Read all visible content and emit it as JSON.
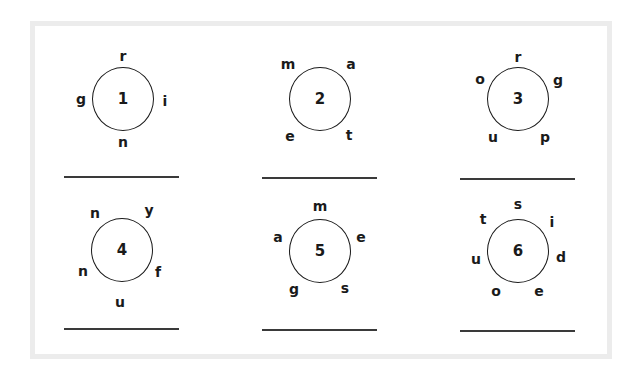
{
  "worksheet": {
    "puzzles": [
      {
        "number": "1",
        "letters": [
          {
            "char": "r",
            "dx": 0,
            "dy": -43
          },
          {
            "char": "g",
            "dx": -42,
            "dy": 0
          },
          {
            "char": "i",
            "dx": 42,
            "dy": 2
          },
          {
            "char": "n",
            "dx": 0,
            "dy": 43
          }
        ]
      },
      {
        "number": "2",
        "letters": [
          {
            "char": "m",
            "dx": -32,
            "dy": -35
          },
          {
            "char": "a",
            "dx": 31,
            "dy": -35
          },
          {
            "char": "e",
            "dx": -30,
            "dy": 37
          },
          {
            "char": "t",
            "dx": 29,
            "dy": 36
          }
        ]
      },
      {
        "number": "3",
        "letters": [
          {
            "char": "r",
            "dx": 0,
            "dy": -42
          },
          {
            "char": "o",
            "dx": -38,
            "dy": -20
          },
          {
            "char": "g",
            "dx": 40,
            "dy": -19
          },
          {
            "char": "u",
            "dx": -25,
            "dy": 38
          },
          {
            "char": "p",
            "dx": 27,
            "dy": 38
          }
        ]
      },
      {
        "number": "4",
        "letters": [
          {
            "char": "n",
            "dx": -27,
            "dy": -37
          },
          {
            "char": "y",
            "dx": 27,
            "dy": -40
          },
          {
            "char": "n",
            "dx": -39,
            "dy": 21
          },
          {
            "char": "f",
            "dx": 36,
            "dy": 22
          },
          {
            "char": "u",
            "dx": -2,
            "dy": 52
          }
        ]
      },
      {
        "number": "5",
        "letters": [
          {
            "char": "m",
            "dx": 0,
            "dy": -45
          },
          {
            "char": "a",
            "dx": -42,
            "dy": -14
          },
          {
            "char": "e",
            "dx": 41,
            "dy": -14
          },
          {
            "char": "g",
            "dx": -26,
            "dy": 38
          },
          {
            "char": "s",
            "dx": 25,
            "dy": 37
          }
        ]
      },
      {
        "number": "6",
        "letters": [
          {
            "char": "s",
            "dx": 0,
            "dy": -47
          },
          {
            "char": "t",
            "dx": -35,
            "dy": -32
          },
          {
            "char": "i",
            "dx": 34,
            "dy": -29
          },
          {
            "char": "u",
            "dx": -42,
            "dy": 8
          },
          {
            "char": "d",
            "dx": 43,
            "dy": 6
          },
          {
            "char": "o",
            "dx": -22,
            "dy": 40
          },
          {
            "char": "e",
            "dx": 21,
            "dy": 40
          }
        ]
      }
    ],
    "answers": [
      "",
      "",
      "",
      "",
      "",
      ""
    ]
  },
  "colors": {
    "frame": "#ececec",
    "ink": "#1a1a1a"
  }
}
